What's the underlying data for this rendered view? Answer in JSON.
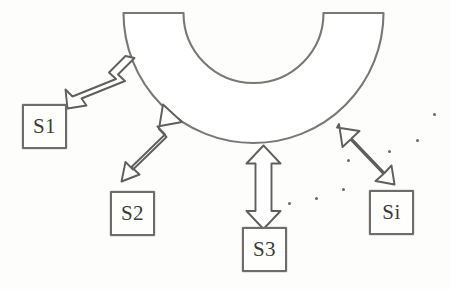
{
  "diagram": {
    "title": "",
    "type": "star-topology-half-annulus",
    "colors": {
      "stroke": "#6e6d6b",
      "shape_stroke": "#7a7875",
      "arrow_stroke": "#5f5e5c",
      "text": "#3b3a38",
      "background": "#fdfdfc",
      "dot": "#6b6a68"
    },
    "hub": {
      "name": "half-annulus-shape",
      "center_x": 253.5,
      "center_y": 13,
      "outer_radius": 130,
      "inner_radius": 70,
      "orientation": "opens-upward",
      "label": ""
    },
    "nodes": [
      {
        "id": "S1",
        "label": "S1",
        "x": 22,
        "y": 104,
        "w": 45,
        "h": 45
      },
      {
        "id": "S2",
        "label": "S2",
        "x": 110,
        "y": 191,
        "w": 45,
        "h": 45
      },
      {
        "id": "S3",
        "label": "S3",
        "x": 242,
        "y": 227,
        "w": 45,
        "h": 45
      },
      {
        "id": "Si",
        "label": "Si",
        "x": 369,
        "y": 190,
        "w": 45,
        "h": 45
      }
    ],
    "connectors": [
      {
        "name": "connector-s1",
        "from": "S1",
        "to": "hub",
        "style": "double-headed-arrow"
      },
      {
        "name": "connector-s2",
        "from": "S2",
        "to": "hub",
        "style": "double-headed-arrow"
      },
      {
        "name": "connector-s3",
        "from": "S3",
        "to": "hub",
        "style": "double-headed-arrow"
      },
      {
        "name": "connector-si",
        "from": "Si",
        "to": "hub",
        "style": "double-headed-arrow"
      }
    ],
    "ellipsis_dots": [
      {
        "x": 289,
        "y": 203
      },
      {
        "x": 316,
        "y": 198
      },
      {
        "x": 343,
        "y": 189
      },
      {
        "x": 348,
        "y": 160
      },
      {
        "x": 417,
        "y": 140
      },
      {
        "x": 434,
        "y": 114
      },
      {
        "x": 389,
        "y": 151
      }
    ]
  }
}
